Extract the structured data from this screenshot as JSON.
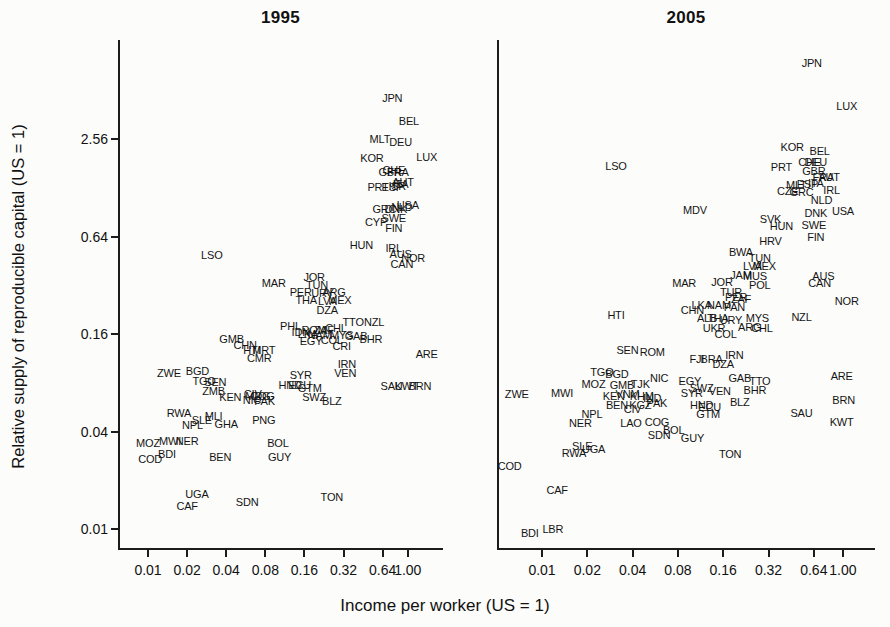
{
  "figure": {
    "y_axis_label": "Relative supply of reproducible capital (US = 1)",
    "x_axis_label": "Income per worker (US = 1)"
  },
  "chart_data": [
    {
      "type": "scatter",
      "title": "1995",
      "xlabel": "Income per worker (US = 1)",
      "ylabel": "Relative supply of reproducible capital (US = 1)",
      "xscale": "log",
      "yscale": "log",
      "xlim": [
        0.005,
        1.9
      ],
      "ylim": [
        0.008,
        11
      ],
      "x_tick_values": [
        0.01,
        0.02,
        0.04,
        0.08,
        0.16,
        0.32,
        0.64,
        1.0
      ],
      "y_tick_values": [
        2.56,
        0.64,
        0.16,
        0.04,
        0.01
      ],
      "grid": false,
      "marker": "country-code-text",
      "points": [
        [
          "JPN",
          0.76,
          4.6
        ],
        [
          "BEL",
          1.02,
          3.3
        ],
        [
          "MLT",
          0.61,
          2.56
        ],
        [
          "DEU",
          0.88,
          2.45
        ],
        [
          "KOR",
          0.53,
          1.95
        ],
        [
          "LUX",
          1.4,
          1.97
        ],
        [
          "GBR",
          0.73,
          1.6
        ],
        [
          "CHE",
          0.78,
          1.65
        ],
        [
          "FRA",
          0.84,
          1.6
        ],
        [
          "PRT",
          0.59,
          1.3
        ],
        [
          "ESP",
          0.76,
          1.3
        ],
        [
          "ISR",
          0.83,
          1.32
        ],
        [
          "ITA",
          0.88,
          1.35
        ],
        [
          "AUT",
          0.92,
          1.38
        ],
        [
          "GRC",
          0.66,
          0.95
        ],
        [
          "DNK",
          0.81,
          0.95
        ],
        [
          "NLD",
          0.9,
          0.97
        ],
        [
          "USA",
          1.0,
          1.0
        ],
        [
          "SWE",
          0.78,
          0.83
        ],
        [
          "CYP",
          0.57,
          0.79
        ],
        [
          "FIN",
          0.78,
          0.72
        ],
        [
          "HUN",
          0.44,
          0.57
        ],
        [
          "IRL",
          0.78,
          0.54
        ],
        [
          "AUS",
          0.88,
          0.5
        ],
        [
          "NOR",
          1.1,
          0.47
        ],
        [
          "CAN",
          0.9,
          0.43
        ],
        [
          "LSO",
          0.031,
          0.49
        ],
        [
          "MAR",
          0.093,
          0.33
        ],
        [
          "JOR",
          0.19,
          0.36
        ],
        [
          "TUN",
          0.2,
          0.32
        ],
        [
          "PER",
          0.15,
          0.29
        ],
        [
          "URY",
          0.22,
          0.285
        ],
        [
          "ARG",
          0.27,
          0.29
        ],
        [
          "THA",
          0.165,
          0.26
        ],
        [
          "LVA",
          0.24,
          0.255
        ],
        [
          "MEX",
          0.3,
          0.26
        ],
        [
          "DZA",
          0.24,
          0.225
        ],
        [
          "TTO",
          0.38,
          0.19
        ],
        [
          "NZL",
          0.55,
          0.19
        ],
        [
          "ROM",
          0.19,
          0.17
        ],
        [
          "ZAF",
          0.225,
          0.17
        ],
        [
          "CHL",
          0.28,
          0.175
        ],
        [
          "PHL",
          0.125,
          0.18
        ],
        [
          "IDN",
          0.15,
          0.165
        ],
        [
          "LKA",
          0.17,
          0.16
        ],
        [
          "NAM",
          0.21,
          0.158
        ],
        [
          "MYS",
          0.31,
          0.157
        ],
        [
          "GAB",
          0.4,
          0.155
        ],
        [
          "BHR",
          0.52,
          0.15
        ],
        [
          "GMB",
          0.044,
          0.148
        ],
        [
          "CHN",
          0.056,
          0.137
        ],
        [
          "EGY",
          0.18,
          0.144
        ],
        [
          "COL",
          0.26,
          0.147
        ],
        [
          "CRI",
          0.31,
          0.134
        ],
        [
          "HTI",
          0.063,
          0.128
        ],
        [
          "MRT",
          0.078,
          0.127
        ],
        [
          "CMR",
          0.072,
          0.114
        ],
        [
          "IRN",
          0.34,
          0.105
        ],
        [
          "ARE",
          1.4,
          0.12
        ],
        [
          "ZWE",
          0.0145,
          0.092
        ],
        [
          "BGD",
          0.024,
          0.094
        ],
        [
          "VEN",
          0.33,
          0.092
        ],
        [
          "TGO",
          0.027,
          0.082
        ],
        [
          "SEN",
          0.033,
          0.081
        ],
        [
          "SYR",
          0.15,
          0.089
        ],
        [
          "HND",
          0.124,
          0.078
        ],
        [
          "ECU",
          0.147,
          0.077
        ],
        [
          "GTM",
          0.176,
          0.074
        ],
        [
          "SAU",
          0.75,
          0.076
        ],
        [
          "KWT",
          0.98,
          0.076
        ],
        [
          "BRN",
          1.24,
          0.076
        ],
        [
          "ZMB",
          0.032,
          0.071
        ],
        [
          "KEN",
          0.043,
          0.065
        ],
        [
          "NIC",
          0.063,
          0.063
        ],
        [
          "PAK",
          0.079,
          0.062
        ],
        [
          "CIV",
          0.064,
          0.068
        ],
        [
          "MDG",
          0.07,
          0.066
        ],
        [
          "COG",
          0.076,
          0.066
        ],
        [
          "SWZ",
          0.19,
          0.065
        ],
        [
          "BLZ",
          0.26,
          0.062
        ],
        [
          "RWA",
          0.0173,
          0.052
        ],
        [
          "MLI",
          0.032,
          0.05
        ],
        [
          "SLE",
          0.026,
          0.047
        ],
        [
          "NPL",
          0.022,
          0.044
        ],
        [
          "GHA",
          0.04,
          0.0445
        ],
        [
          "PNG",
          0.078,
          0.047
        ],
        [
          "MOZ",
          0.01,
          0.034
        ],
        [
          "MWI",
          0.0148,
          0.035
        ],
        [
          "NER",
          0.02,
          0.035
        ],
        [
          "BDI",
          0.014,
          0.029
        ],
        [
          "COD",
          0.0104,
          0.027
        ],
        [
          "BEN",
          0.036,
          0.028
        ],
        [
          "BOL",
          0.1,
          0.034
        ],
        [
          "GUY",
          0.103,
          0.028
        ],
        [
          "UGA",
          0.0238,
          0.0164
        ],
        [
          "CAF",
          0.02,
          0.0139
        ],
        [
          "SDN",
          0.058,
          0.0146
        ],
        [
          "TON",
          0.26,
          0.0157
        ]
      ]
    },
    {
      "type": "scatter",
      "title": "2005",
      "xlabel": "Income per worker (US = 1)",
      "ylabel": "Relative supply of reproducible capital (US = 1)",
      "xscale": "log",
      "yscale": "log",
      "xlim": [
        0.005,
        1.7
      ],
      "ylim": [
        0.008,
        11
      ],
      "x_tick_values": [
        0.01,
        0.02,
        0.04,
        0.08,
        0.16,
        0.32,
        0.64,
        1.0
      ],
      "y_tick_values": [
        2.56,
        0.64,
        0.16,
        0.04,
        0.01
      ],
      "grid": false,
      "marker": "country-code-text",
      "points": [
        [
          "JPN",
          0.62,
          7.5
        ],
        [
          "LUX",
          1.06,
          4.1
        ],
        [
          "KOR",
          0.46,
          2.3
        ],
        [
          "BEL",
          0.7,
          2.15
        ],
        [
          "CHE",
          0.6,
          1.85
        ],
        [
          "DEU",
          0.66,
          1.85
        ],
        [
          "PRT",
          0.39,
          1.72
        ],
        [
          "GBR",
          0.64,
          1.62
        ],
        [
          "FRA",
          0.74,
          1.5
        ],
        [
          "AUT",
          0.81,
          1.5
        ],
        [
          "MLT",
          0.49,
          1.33
        ],
        [
          "ESP",
          0.58,
          1.35
        ],
        [
          "ITA",
          0.66,
          1.37
        ],
        [
          "CZE",
          0.43,
          1.22
        ],
        [
          "GRC",
          0.53,
          1.2
        ],
        [
          "IRL",
          0.84,
          1.24
        ],
        [
          "NLD",
          0.72,
          1.07
        ],
        [
          "DNK",
          0.66,
          0.9
        ],
        [
          "USA",
          1.0,
          0.92
        ],
        [
          "SVK",
          0.33,
          0.82
        ],
        [
          "HUN",
          0.39,
          0.74
        ],
        [
          "SWE",
          0.64,
          0.75
        ],
        [
          "FIN",
          0.66,
          0.64
        ],
        [
          "LSO",
          0.031,
          1.74
        ],
        [
          "MDV",
          0.104,
          0.93
        ],
        [
          "HRV",
          0.33,
          0.6
        ],
        [
          "BWA",
          0.21,
          0.51
        ],
        [
          "TUN",
          0.28,
          0.47
        ],
        [
          "MEX",
          0.3,
          0.42
        ],
        [
          "LVA",
          0.25,
          0.42
        ],
        [
          "JAM",
          0.21,
          0.37
        ],
        [
          "MUS",
          0.26,
          0.365
        ],
        [
          "MAR",
          0.088,
          0.33
        ],
        [
          "JOR",
          0.157,
          0.335
        ],
        [
          "POL",
          0.28,
          0.32
        ],
        [
          "AUS",
          0.74,
          0.365
        ],
        [
          "CAN",
          0.7,
          0.33
        ],
        [
          "NOR",
          1.06,
          0.255
        ],
        [
          "NZL",
          0.53,
          0.205
        ],
        [
          "TUR",
          0.18,
          0.29
        ],
        [
          "PER",
          0.195,
          0.27
        ],
        [
          "ZAF",
          0.21,
          0.265
        ],
        [
          "LKA",
          0.115,
          0.24
        ],
        [
          "NAM",
          0.15,
          0.24
        ],
        [
          "PAN",
          0.19,
          0.235
        ],
        [
          "CHN",
          0.1,
          0.225
        ],
        [
          "ALB",
          0.125,
          0.2
        ],
        [
          "THA",
          0.147,
          0.2
        ],
        [
          "URY",
          0.18,
          0.195
        ],
        [
          "MYS",
          0.27,
          0.2
        ],
        [
          "UKR",
          0.139,
          0.175
        ],
        [
          "ARG",
          0.24,
          0.177
        ],
        [
          "CHL",
          0.29,
          0.175
        ],
        [
          "COL",
          0.166,
          0.16
        ],
        [
          "HTI",
          0.031,
          0.21
        ],
        [
          "SEN",
          0.037,
          0.128
        ],
        [
          "ROM",
          0.054,
          0.123
        ],
        [
          "IRN",
          0.19,
          0.118
        ],
        [
          "FJI",
          0.107,
          0.112
        ],
        [
          "BRA",
          0.134,
          0.112
        ],
        [
          "DZA",
          0.16,
          0.104
        ],
        [
          "TGO",
          0.025,
          0.093
        ],
        [
          "BGD",
          0.0315,
          0.091
        ],
        [
          "MOZ",
          0.022,
          0.079
        ],
        [
          "GMB",
          0.034,
          0.077
        ],
        [
          "TJK",
          0.045,
          0.079
        ],
        [
          "NIC",
          0.06,
          0.086
        ],
        [
          "EGY",
          0.096,
          0.082
        ],
        [
          "SWZ",
          0.115,
          0.074
        ],
        [
          "GAB",
          0.206,
          0.085
        ],
        [
          "TTO",
          0.28,
          0.082
        ],
        [
          "BHR",
          0.26,
          0.072
        ],
        [
          "ARE",
          0.98,
          0.088
        ],
        [
          "SYR",
          0.099,
          0.069
        ],
        [
          "VEN",
          0.152,
          0.071
        ],
        [
          "ZWE",
          0.0068,
          0.068
        ],
        [
          "MWI",
          0.0136,
          0.069
        ],
        [
          "KEN",
          0.03,
          0.066
        ],
        [
          "VNM",
          0.037,
          0.068
        ],
        [
          "KHM",
          0.046,
          0.066
        ],
        [
          "IND",
          0.054,
          0.064
        ],
        [
          "PAK",
          0.058,
          0.06
        ],
        [
          "BEN",
          0.0315,
          0.058
        ],
        [
          "KGZ",
          0.045,
          0.058
        ],
        [
          "CIV",
          0.04,
          0.055
        ],
        [
          "HND",
          0.115,
          0.058
        ],
        [
          "ECU",
          0.13,
          0.057
        ],
        [
          "GTM",
          0.127,
          0.051
        ],
        [
          "BLZ",
          0.206,
          0.061
        ],
        [
          "NPL",
          0.0215,
          0.051
        ],
        [
          "NER",
          0.018,
          0.045
        ],
        [
          "LAO",
          0.039,
          0.045
        ],
        [
          "COG",
          0.058,
          0.046
        ],
        [
          "BOL",
          0.075,
          0.041
        ],
        [
          "SDN",
          0.06,
          0.038
        ],
        [
          "GUY",
          0.1,
          0.0365
        ],
        [
          "SAU",
          0.53,
          0.052
        ],
        [
          "BRN",
          1.01,
          0.063
        ],
        [
          "KWT",
          0.98,
          0.0455
        ],
        [
          "SLE",
          0.0185,
          0.0325
        ],
        [
          "RWA",
          0.0163,
          0.0295
        ],
        [
          "UGA",
          0.022,
          0.031
        ],
        [
          "TON",
          0.178,
          0.029
        ],
        [
          "COD",
          0.0061,
          0.0244
        ],
        [
          "CAF",
          0.0126,
          0.0174
        ],
        [
          "LBR",
          0.0118,
          0.01
        ],
        [
          "BDI",
          0.0083,
          0.0094
        ]
      ]
    }
  ]
}
